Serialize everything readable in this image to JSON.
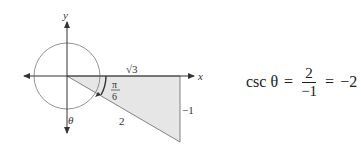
{
  "diagram": {
    "axis_labels": {
      "x": "x",
      "y": "y"
    },
    "triangle_labels": {
      "adjacent": "√3",
      "opposite": "−1",
      "hypotenuse": "2",
      "reference_angle_num": "π",
      "reference_angle_den": "6"
    },
    "angle_label": "θ",
    "fill_color": "#e6e6e6",
    "stroke_color": "#555555"
  },
  "equation": {
    "lhs": "csc θ",
    "eq1": "=",
    "frac_num": "2",
    "frac_den": "−1",
    "eq2": "=",
    "result": "−2"
  }
}
